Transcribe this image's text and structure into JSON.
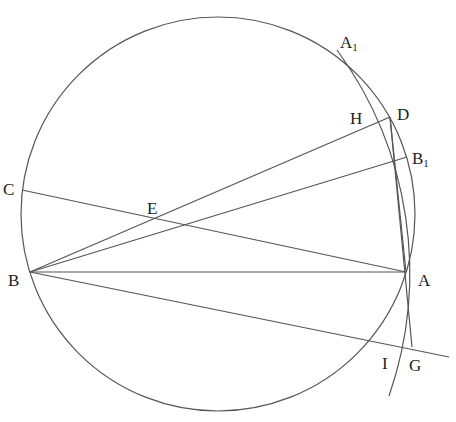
{
  "diagram": {
    "type": "geometric-construction",
    "colors": {
      "stroke": "#555555",
      "label": "#222222",
      "background": "#ffffff"
    },
    "circle": {
      "cx": 218,
      "cy": 214,
      "r": 197
    },
    "arc": {
      "center": "B",
      "radius": 377,
      "from": [
        337,
        50
      ],
      "to": [
        389,
        396
      ]
    },
    "points": {
      "A": {
        "label": "A",
        "sub": "",
        "x": 406,
        "y": 272
      },
      "B": {
        "label": "B",
        "sub": "",
        "x": 30,
        "y": 272
      },
      "C": {
        "label": "C",
        "sub": "",
        "x": 22,
        "y": 190
      },
      "D": {
        "label": "D",
        "sub": "",
        "x": 390,
        "y": 117
      },
      "E": {
        "label": "E",
        "sub": "",
        "x": 153,
        "y": 222
      },
      "H": {
        "label": "H",
        "sub": "",
        "x": 372,
        "y": 127
      },
      "A1": {
        "label": "A",
        "sub": "1",
        "x": 337,
        "y": 52
      },
      "B1": {
        "label": "B",
        "sub": "1",
        "x": 407,
        "y": 157
      },
      "I": {
        "label": "I",
        "sub": "",
        "x": 382,
        "y": 344
      },
      "G": {
        "label": "G",
        "sub": "",
        "x": 412,
        "y": 347
      }
    },
    "segments": [
      [
        "B",
        "A"
      ],
      [
        "B",
        "D"
      ],
      [
        "B",
        "B1"
      ],
      [
        "C",
        "A"
      ],
      [
        "D",
        "A"
      ],
      [
        "D",
        "G"
      ]
    ],
    "extended_line": {
      "from": [
        30,
        272
      ],
      "to": [
        449,
        357
      ]
    },
    "labels": [
      {
        "id": "A1",
        "text": "A",
        "sub": "1",
        "x": 340,
        "y": 34
      },
      {
        "id": "D",
        "text": "D",
        "sub": "",
        "x": 397,
        "y": 106
      },
      {
        "id": "H",
        "text": "H",
        "sub": "",
        "x": 350,
        "y": 110
      },
      {
        "id": "B1",
        "text": "B",
        "sub": "1",
        "x": 412,
        "y": 150
      },
      {
        "id": "C",
        "text": "C",
        "sub": "",
        "x": 3,
        "y": 181
      },
      {
        "id": "E",
        "text": "E",
        "sub": "",
        "x": 147,
        "y": 200
      },
      {
        "id": "B",
        "text": "B",
        "sub": "",
        "x": 8,
        "y": 272
      },
      {
        "id": "A",
        "text": "A",
        "sub": "",
        "x": 418,
        "y": 272
      },
      {
        "id": "I",
        "text": "I",
        "sub": "",
        "x": 382,
        "y": 355
      },
      {
        "id": "G",
        "text": "G",
        "sub": "",
        "x": 409,
        "y": 357
      }
    ]
  }
}
